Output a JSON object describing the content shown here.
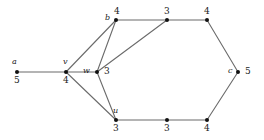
{
  "figure": {
    "width": 264,
    "height": 140,
    "background_color": "#ffffff",
    "edge_color": "#6b6b6b",
    "vertex_color": "#111111",
    "text_color": "#1a1a1a"
  },
  "graph": {
    "type": "undirected-weighted-vertex-labeled-graph",
    "nodes": [
      {
        "id": "a",
        "name": "a",
        "weight": "5",
        "x": 17,
        "y": 72,
        "name_dx": -5,
        "name_dy": -14,
        "weight_dx": -3,
        "weight_dy": 4
      },
      {
        "id": "v",
        "name": "v",
        "weight": "4",
        "x": 66,
        "y": 72,
        "name_dx": -3,
        "name_dy": -14,
        "weight_dx": -3,
        "weight_dy": 4
      },
      {
        "id": "w",
        "name": "w",
        "weight": "3",
        "x": 97,
        "y": 72,
        "name_dx": -14,
        "name_dy": -5,
        "weight_dx": 7,
        "weight_dy": -5
      },
      {
        "id": "b",
        "name": "b",
        "weight": "4",
        "x": 116,
        "y": 20,
        "name_dx": -11,
        "name_dy": -6,
        "weight_dx": -2,
        "weight_dy": -13
      },
      {
        "id": "t1",
        "name": "",
        "weight": "3",
        "x": 167,
        "y": 20,
        "name_dx": 0,
        "name_dy": 0,
        "weight_dx": -3,
        "weight_dy": -13
      },
      {
        "id": "t2",
        "name": "",
        "weight": "4",
        "x": 207,
        "y": 20,
        "name_dx": 0,
        "name_dy": 0,
        "weight_dx": -3,
        "weight_dy": -13
      },
      {
        "id": "c",
        "name": "c",
        "weight": "5",
        "x": 238,
        "y": 72,
        "name_dx": -10,
        "name_dy": -5,
        "weight_dx": 7,
        "weight_dy": -5
      },
      {
        "id": "b2",
        "name": "",
        "weight": "4",
        "x": 207,
        "y": 120,
        "name_dx": 0,
        "name_dy": 0,
        "weight_dx": -3,
        "weight_dy": 4
      },
      {
        "id": "b1",
        "name": "",
        "weight": "3",
        "x": 167,
        "y": 120,
        "name_dx": 0,
        "name_dy": 0,
        "weight_dx": -3,
        "weight_dy": 4
      },
      {
        "id": "u",
        "name": "u",
        "weight": "3",
        "x": 116,
        "y": 120,
        "name_dx": -3,
        "name_dy": -13,
        "weight_dx": -3,
        "weight_dy": 4
      }
    ],
    "edges": [
      {
        "from": "a",
        "to": "v"
      },
      {
        "from": "v",
        "to": "b"
      },
      {
        "from": "v",
        "to": "w"
      },
      {
        "from": "v",
        "to": "u"
      },
      {
        "from": "w",
        "to": "b"
      },
      {
        "from": "w",
        "to": "u"
      },
      {
        "from": "w",
        "to": "t1"
      },
      {
        "from": "b",
        "to": "t1"
      },
      {
        "from": "t1",
        "to": "t2"
      },
      {
        "from": "t2",
        "to": "c"
      },
      {
        "from": "c",
        "to": "b2"
      },
      {
        "from": "b2",
        "to": "b1"
      },
      {
        "from": "b1",
        "to": "u"
      }
    ]
  }
}
